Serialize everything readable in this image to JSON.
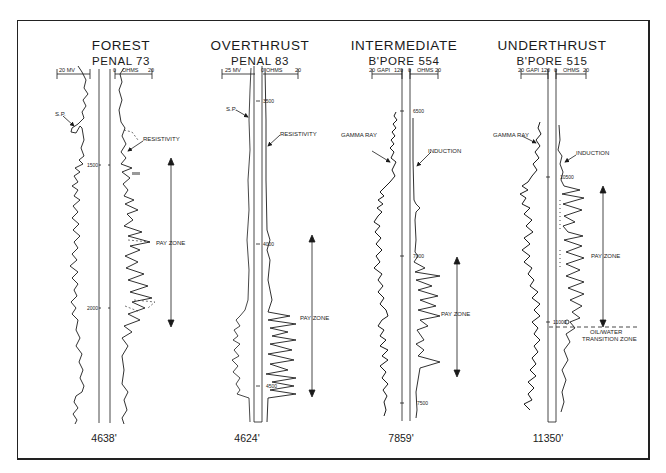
{
  "figure": {
    "background": "#ffffff",
    "ink": "#1a1a1a"
  },
  "wells": [
    {
      "title": "FOREST",
      "subtitle": "PENAL 73",
      "left_track": {
        "curve": "S.P.",
        "scale_left": "20 MV",
        "scale_right": ""
      },
      "right_track": {
        "curve": "RESISTIVITY",
        "scale_left": "0",
        "unit": "OHMS",
        "scale_right": "20"
      },
      "depth_marks": [
        "1500",
        "2000"
      ],
      "annotations": [
        "S.P.",
        "RESISTIVITY",
        "PAY ZONE"
      ],
      "total_depth": "4638'"
    },
    {
      "title": "OVERTHRUST",
      "subtitle": "PENAL 83",
      "left_track": {
        "curve": "S.P.",
        "scale_left": "25 MV",
        "scale_right": ""
      },
      "right_track": {
        "curve": "RESISTIVITY",
        "scale_left": "0",
        "unit": "OHMS",
        "scale_right": "20"
      },
      "depth_marks": [
        "3500",
        "4000",
        "4500"
      ],
      "annotations": [
        "S.P.",
        "RESISTIVITY",
        "PAY ZONE"
      ],
      "total_depth": "4624'"
    },
    {
      "title": "INTERMEDIATE",
      "subtitle": "B'PORE 554",
      "left_track": {
        "curve": "GAMMA RAY",
        "scale_left": "20",
        "unit": "GAPI",
        "scale_right": "120"
      },
      "right_track": {
        "curve": "INDUCTION",
        "scale_left": "0",
        "unit": "OHMS",
        "scale_right": "20"
      },
      "depth_marks": [
        "6500",
        "7000",
        "7500"
      ],
      "annotations": [
        "GAMMA RAY",
        "INDUCTION",
        "PAY ZONE"
      ],
      "total_depth": "7859'"
    },
    {
      "title": "UNDERTHRUST",
      "subtitle": "B'PORE 515",
      "left_track": {
        "curve": "GAMMA RAY",
        "scale_left": "20",
        "unit": "GAPI",
        "scale_right": "120"
      },
      "right_track": {
        "curve": "INDUCTION",
        "scale_left": "0",
        "unit": "OHMS",
        "scale_right": "20"
      },
      "depth_marks": [
        "10500",
        "11000"
      ],
      "annotations": [
        "GAMMA RAY",
        "INDUCTION",
        "PAY ZONE",
        "OIL/WATER",
        "TRANSITION ZONE"
      ],
      "total_depth": "11350'"
    }
  ]
}
